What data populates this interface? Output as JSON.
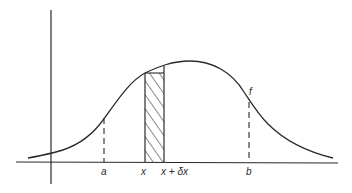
{
  "diagram": {
    "title": "",
    "type": "probability-density-curve",
    "curve_label": "f",
    "axis_labels": {
      "a": "a",
      "x": "x",
      "x_plus_dx": "x + δx",
      "b": "b"
    },
    "elements": {
      "curve": "bell-shaped density curve f",
      "strip": "hatched strip between x and x + δx",
      "bound_a": "dashed vertical line at a",
      "bound_b": "dashed vertical line at b"
    },
    "colors": {
      "stroke": "#2a2a2a",
      "background": "#ffffff"
    }
  }
}
